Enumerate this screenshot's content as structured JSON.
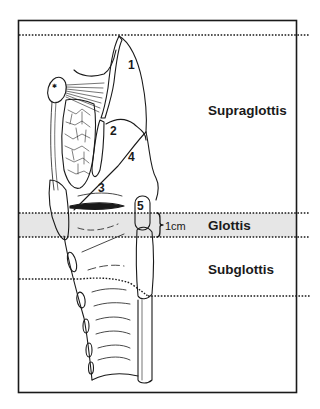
{
  "diagram": {
    "type": "anatomical-sagittal-section",
    "regions": [
      {
        "id": "supraglottis",
        "label": "Supraglottis"
      },
      {
        "id": "glottis",
        "label": "Glottis"
      },
      {
        "id": "subglottis",
        "label": "Subglottis"
      }
    ],
    "measurement": {
      "label": "1cm"
    },
    "numbered_structures": [
      {
        "number": "1"
      },
      {
        "number": "2"
      },
      {
        "number": "3"
      },
      {
        "number": "4"
      },
      {
        "number": "5"
      }
    ],
    "colors": {
      "line": "#1a1a1a",
      "glottis_band": "#e6e6e6",
      "background": "#ffffff"
    }
  }
}
